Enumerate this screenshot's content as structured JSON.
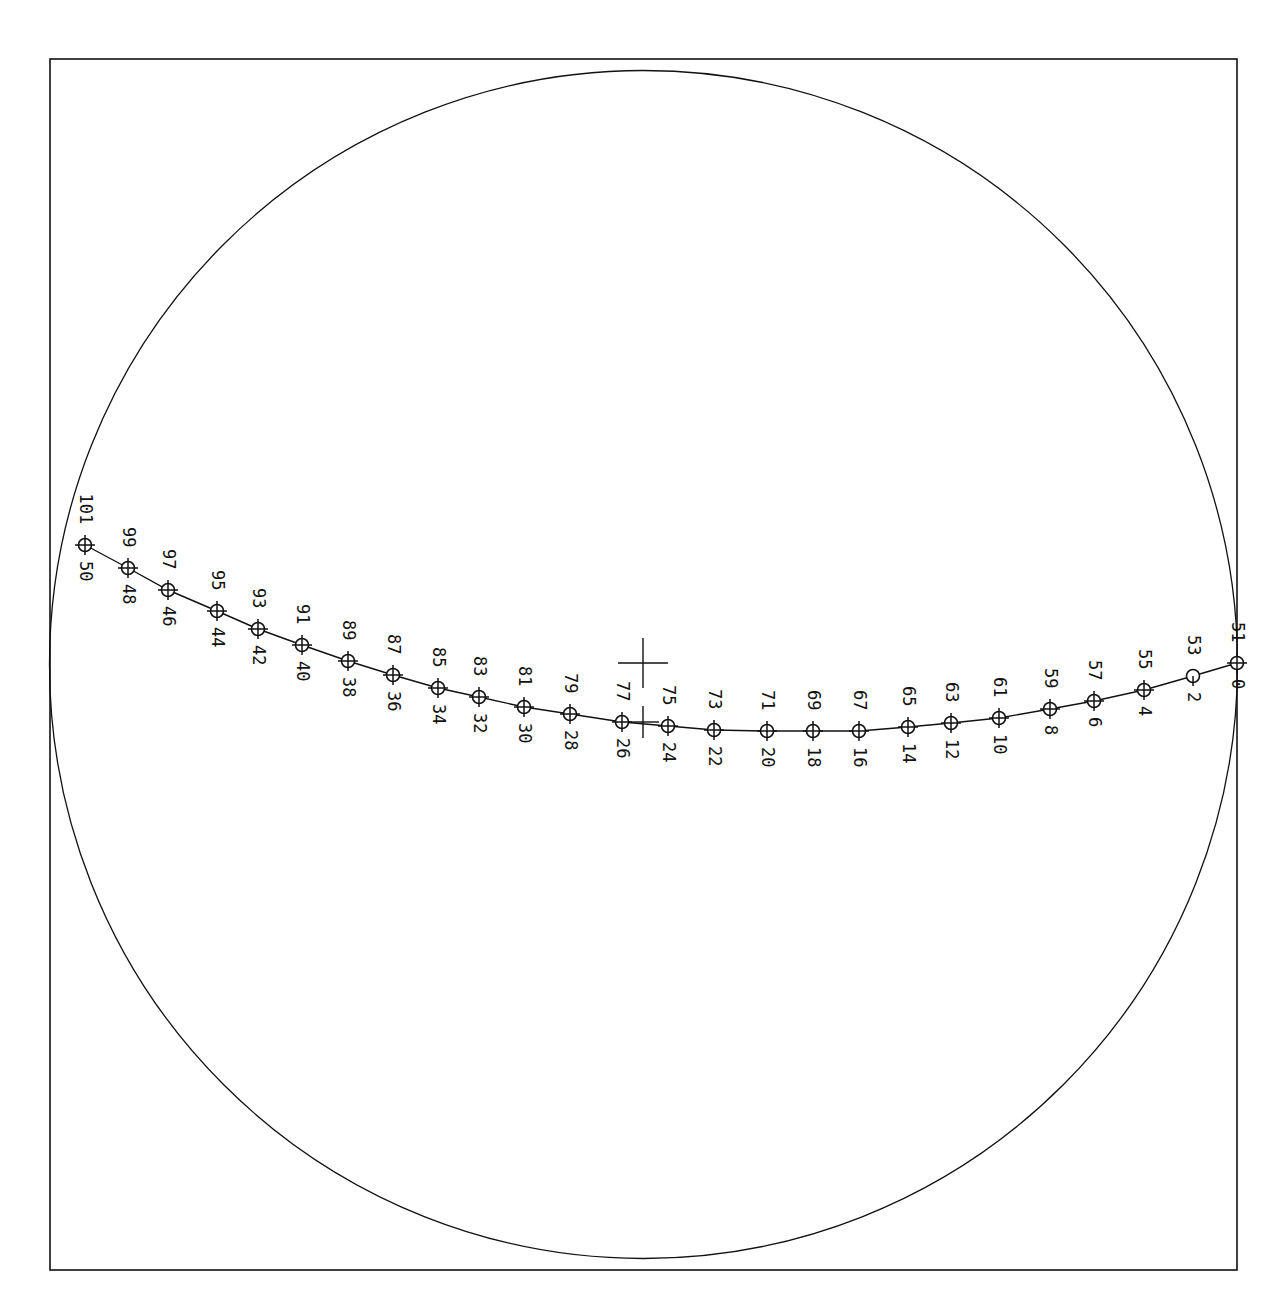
{
  "frame": {
    "x": 50,
    "y": 59,
    "width": 1187,
    "height": 1211
  },
  "circle": {
    "cx": 643.5,
    "cy": 664.5,
    "r": 594
  },
  "center_cross": {
    "x": 643,
    "y": 663,
    "arm": 25
  },
  "track_cross": {
    "x": 643,
    "y": 722,
    "arm": 16
  },
  "colors": {
    "line": "#111111",
    "background": "#ffffff"
  },
  "chart_data": {
    "type": "scatter",
    "title": "",
    "points": [
      {
        "x": 85,
        "y": 545,
        "label_top": "101",
        "label_bottom": "50"
      },
      {
        "x": 128,
        "y": 568,
        "label_top": "99",
        "label_bottom": "48"
      },
      {
        "x": 168,
        "y": 590,
        "label_top": "97",
        "label_bottom": "46"
      },
      {
        "x": 217,
        "y": 611,
        "label_top": "95",
        "label_bottom": "44"
      },
      {
        "x": 258,
        "y": 629,
        "label_top": "93",
        "label_bottom": "42"
      },
      {
        "x": 302,
        "y": 645,
        "label_top": "91",
        "label_bottom": "40"
      },
      {
        "x": 348,
        "y": 661,
        "label_top": "89",
        "label_bottom": "38"
      },
      {
        "x": 393,
        "y": 675,
        "label_top": "87",
        "label_bottom": "36"
      },
      {
        "x": 438,
        "y": 688,
        "label_top": "85",
        "label_bottom": "34"
      },
      {
        "x": 479,
        "y": 697,
        "label_top": "83",
        "label_bottom": "32"
      },
      {
        "x": 524,
        "y": 707,
        "label_top": "81",
        "label_bottom": "30"
      },
      {
        "x": 570,
        "y": 714,
        "label_top": "79",
        "label_bottom": "28"
      },
      {
        "x": 622,
        "y": 722,
        "label_top": "77",
        "label_bottom": "26"
      },
      {
        "x": 668,
        "y": 726,
        "label_top": "75",
        "label_bottom": "24"
      },
      {
        "x": 714,
        "y": 730,
        "label_top": "73",
        "label_bottom": "22"
      },
      {
        "x": 767,
        "y": 731,
        "label_top": "71",
        "label_bottom": "20"
      },
      {
        "x": 813,
        "y": 731,
        "label_top": "69",
        "label_bottom": "18"
      },
      {
        "x": 859,
        "y": 731,
        "label_top": "67",
        "label_bottom": "16"
      },
      {
        "x": 908,
        "y": 727,
        "label_top": "65",
        "label_bottom": "14"
      },
      {
        "x": 951,
        "y": 723,
        "label_top": "63",
        "label_bottom": "12"
      },
      {
        "x": 999,
        "y": 718,
        "label_top": "61",
        "label_bottom": "10"
      },
      {
        "x": 1050,
        "y": 709,
        "label_top": "59",
        "label_bottom": "8"
      },
      {
        "x": 1094,
        "y": 701,
        "label_top": "57",
        "label_bottom": "6"
      },
      {
        "x": 1144,
        "y": 690,
        "label_top": "55",
        "label_bottom": "4"
      },
      {
        "x": 1193,
        "y": 676,
        "label_top": "53",
        "label_bottom": "2",
        "marker": "open"
      },
      {
        "x": 1237,
        "y": 663,
        "label_top": "51",
        "label_bottom": "0"
      }
    ],
    "grid": false,
    "legend": null
  }
}
